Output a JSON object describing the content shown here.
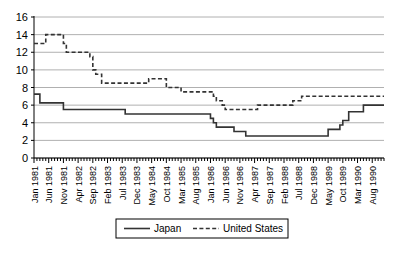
{
  "chart_data": {
    "type": "line",
    "title": "",
    "subtitle": "",
    "xlabel": "",
    "ylabel": "",
    "ylim": [
      0,
      16
    ],
    "yticks": [
      0,
      2,
      4,
      6,
      8,
      10,
      12,
      14,
      16
    ],
    "ytick_labels": [
      "0",
      "2",
      "4",
      "6",
      "8",
      "10",
      "12",
      "14",
      "16"
    ],
    "grid": "horizontal",
    "legend_position": "bottom-center",
    "xtick_labels": [
      "Jan 1981",
      "Jun 1981",
      "Nov 1981",
      "Apr 1982",
      "Sep 1982",
      "Feb 1983",
      "Jul 1983",
      "Dec 1983",
      "May 1984",
      "Oct 1984",
      "Mar 1985",
      "Aug 1985",
      "Jan 1986",
      "Jun 1986",
      "Nov 1986",
      "Apr 1987",
      "Sep 1987",
      "Feb 1988",
      "Jul 1988",
      "Dec 1988",
      "May 1989",
      "Oct 1989",
      "Mar 1990",
      "Aug 1990"
    ],
    "xtick_indices": [
      0,
      5,
      10,
      15,
      20,
      25,
      30,
      35,
      40,
      45,
      50,
      55,
      60,
      65,
      70,
      75,
      80,
      85,
      90,
      95,
      100,
      105,
      110,
      115
    ],
    "x_count": 120,
    "series": [
      {
        "name": "Japan",
        "style": "solid",
        "color": "#333333",
        "values": [
          7.25,
          7.25,
          6.25,
          6.25,
          6.25,
          6.25,
          6.25,
          6.25,
          6.25,
          6.25,
          5.5,
          5.5,
          5.5,
          5.5,
          5.5,
          5.5,
          5.5,
          5.5,
          5.5,
          5.5,
          5.5,
          5.5,
          5.5,
          5.5,
          5.5,
          5.5,
          5.5,
          5.5,
          5.5,
          5.5,
          5.5,
          5.0,
          5.0,
          5.0,
          5.0,
          5.0,
          5.0,
          5.0,
          5.0,
          5.0,
          5.0,
          5.0,
          5.0,
          5.0,
          5.0,
          5.0,
          5.0,
          5.0,
          5.0,
          5.0,
          5.0,
          5.0,
          5.0,
          5.0,
          5.0,
          5.0,
          5.0,
          5.0,
          5.0,
          5.0,
          4.5,
          4.0,
          3.5,
          3.5,
          3.5,
          3.5,
          3.5,
          3.5,
          3.0,
          3.0,
          3.0,
          3.0,
          2.5,
          2.5,
          2.5,
          2.5,
          2.5,
          2.5,
          2.5,
          2.5,
          2.5,
          2.5,
          2.5,
          2.5,
          2.5,
          2.5,
          2.5,
          2.5,
          2.5,
          2.5,
          2.5,
          2.5,
          2.5,
          2.5,
          2.5,
          2.5,
          2.5,
          2.5,
          2.5,
          2.5,
          3.25,
          3.25,
          3.25,
          3.25,
          3.75,
          4.25,
          4.25,
          5.25,
          5.25,
          5.25,
          5.25,
          5.25,
          6.0,
          6.0,
          6.0,
          6.0,
          6.0,
          6.0,
          6.0,
          6.0
        ]
      },
      {
        "name": "United States",
        "style": "dashed",
        "color": "#333333",
        "values": [
          13.0,
          13.0,
          13.0,
          13.0,
          14.0,
          14.0,
          14.0,
          14.0,
          14.0,
          14.0,
          13.0,
          12.0,
          12.0,
          12.0,
          12.0,
          12.0,
          12.0,
          12.0,
          12.0,
          11.5,
          10.0,
          9.5,
          9.5,
          8.5,
          8.5,
          8.5,
          8.5,
          8.5,
          8.5,
          8.5,
          8.5,
          8.5,
          8.5,
          8.5,
          8.5,
          8.5,
          8.5,
          8.5,
          8.5,
          9.0,
          9.0,
          9.0,
          9.0,
          9.0,
          9.0,
          8.0,
          8.0,
          8.0,
          8.0,
          8.0,
          7.5,
          7.5,
          7.5,
          7.5,
          7.5,
          7.5,
          7.5,
          7.5,
          7.5,
          7.5,
          7.5,
          7.0,
          6.5,
          6.5,
          6.0,
          5.5,
          5.5,
          5.5,
          5.5,
          5.5,
          5.5,
          5.5,
          5.5,
          5.5,
          5.5,
          5.5,
          6.0,
          6.0,
          6.0,
          6.0,
          6.0,
          6.0,
          6.0,
          6.0,
          6.0,
          6.0,
          6.0,
          6.0,
          6.5,
          6.5,
          6.5,
          7.0,
          7.0,
          7.0,
          7.0,
          7.0,
          7.0,
          7.0,
          7.0,
          7.0,
          7.0,
          7.0,
          7.0,
          7.0,
          7.0,
          7.0,
          7.0,
          7.0,
          7.0,
          7.0,
          7.0,
          7.0,
          7.0,
          7.0,
          7.0,
          7.0,
          7.0,
          7.0,
          7.0,
          7.0
        ]
      }
    ]
  },
  "legend": {
    "items": [
      {
        "label": "Japan",
        "style": "solid"
      },
      {
        "label": "United States",
        "style": "dashed"
      }
    ]
  },
  "colors": {
    "line": "#333333",
    "grid": "#b0b0b0",
    "axis": "#000000",
    "background": "#ffffff"
  }
}
